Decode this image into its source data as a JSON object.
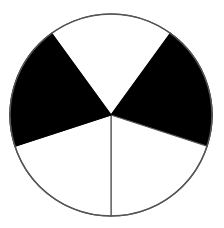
{
  "diagram": {
    "type": "circle-divided-into-sectors",
    "sectors_total": 5,
    "sectors_shaded": 2,
    "fill_shaded": "#000000",
    "fill_unshaded": "#ffffff",
    "stroke": "#555555",
    "center": [
      111,
      115
    ],
    "radius": 101,
    "sectors": [
      {
        "start_deg": 234,
        "end_deg": 306,
        "shaded": false
      },
      {
        "start_deg": 306,
        "end_deg": 378,
        "shaded": true
      },
      {
        "start_deg": 18,
        "end_deg": 90,
        "shaded": false
      },
      {
        "start_deg": 90,
        "end_deg": 162,
        "shaded": false
      },
      {
        "start_deg": 162,
        "end_deg": 234,
        "shaded": true
      }
    ]
  }
}
